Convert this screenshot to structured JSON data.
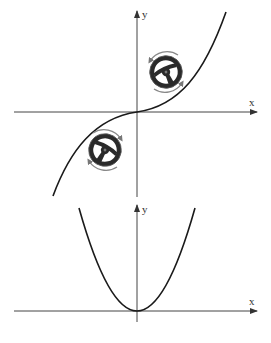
{
  "figure": {
    "colors": {
      "background": "#ffffff",
      "axis": "#444444",
      "curve": "#1a1a1a",
      "wheel": "#2a2a2a",
      "arrow_ring": "#888888"
    }
  },
  "top_plot": {
    "curve_type": "cubic",
    "x_axis_label": "x",
    "y_axis_label": "y",
    "wheels": [
      {
        "position": "upper-right quadrant",
        "rotation": "counter-clockwise top / clockwise bottom"
      },
      {
        "position": "lower-left quadrant",
        "rotation": "clockwise top / counter-clockwise bottom"
      }
    ]
  },
  "bottom_plot": {
    "curve_type": "parabola",
    "x_axis_label": "x",
    "y_axis_label": "y"
  }
}
